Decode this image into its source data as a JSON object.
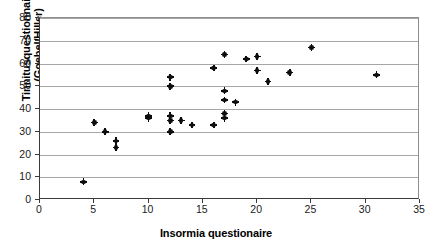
{
  "chart_data": {
    "type": "scatter",
    "title": "",
    "xlabel": "Insormia questionaire",
    "ylabel": "Tinnitusquestionnaire (Goebel/Hiller)",
    "xlim": [
      0,
      35
    ],
    "ylim": [
      0,
      80
    ],
    "xticks": [
      0,
      5,
      10,
      15,
      20,
      25,
      30,
      35
    ],
    "yticks": [
      0,
      10,
      20,
      30,
      40,
      50,
      60,
      70,
      80
    ],
    "grid": "horizontal",
    "legend": "none",
    "marker": "filled-circle-with-cross",
    "marker_color": "#0d0d0d",
    "points": [
      {
        "x": 4,
        "y": 8
      },
      {
        "x": 5,
        "y": 34
      },
      {
        "x": 6,
        "y": 30
      },
      {
        "x": 7,
        "y": 26
      },
      {
        "x": 7,
        "y": 23
      },
      {
        "x": 10,
        "y": 37
      },
      {
        "x": 10,
        "y": 36
      },
      {
        "x": 12,
        "y": 54
      },
      {
        "x": 12,
        "y": 50
      },
      {
        "x": 12,
        "y": 37
      },
      {
        "x": 12,
        "y": 35
      },
      {
        "x": 12,
        "y": 30
      },
      {
        "x": 13,
        "y": 35
      },
      {
        "x": 14,
        "y": 33
      },
      {
        "x": 16,
        "y": 33
      },
      {
        "x": 16,
        "y": 58
      },
      {
        "x": 17,
        "y": 64
      },
      {
        "x": 17,
        "y": 48
      },
      {
        "x": 17,
        "y": 44
      },
      {
        "x": 17,
        "y": 38
      },
      {
        "x": 17,
        "y": 36
      },
      {
        "x": 18,
        "y": 43
      },
      {
        "x": 19,
        "y": 62
      },
      {
        "x": 20,
        "y": 63
      },
      {
        "x": 20,
        "y": 57
      },
      {
        "x": 21,
        "y": 52
      },
      {
        "x": 23,
        "y": 56
      },
      {
        "x": 25,
        "y": 67
      },
      {
        "x": 31,
        "y": 55
      }
    ]
  }
}
